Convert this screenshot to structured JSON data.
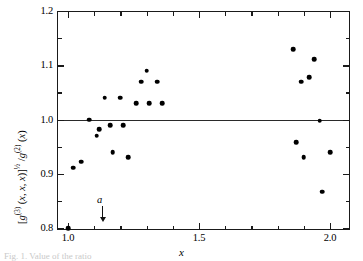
{
  "figure": {
    "caption_partial": "Fig. 1. Value of the ratio",
    "annotation": {
      "label": "a",
      "x_value": 1.13
    }
  },
  "chart_data": {
    "type": "scatter",
    "title": "",
    "xlabel": "x",
    "ylabel": "[g(3)(x, x, x)]^1/2 / g(2)(x)",
    "ylabel_parts": {
      "open_bracket": "[",
      "g3": "g",
      "sup3": "(3)",
      "args3": " (x, x, x)",
      "close_bracket": "]",
      "half": "½",
      "slash": " / ",
      "g2": "g",
      "sup2": "(2)",
      "args2": " (x)"
    },
    "xlim": [
      0.95,
      2.07
    ],
    "ylim": [
      0.8,
      1.2
    ],
    "xticks": [
      1.0,
      1.5,
      2.0
    ],
    "xticklabels": [
      "1.0",
      "1.5",
      "2.0"
    ],
    "xminorticks": [
      1.1,
      1.2,
      1.3,
      1.4,
      1.6,
      1.7,
      1.8,
      1.9
    ],
    "yticks": [
      0.8,
      0.9,
      1.0,
      1.1,
      1.2
    ],
    "yticklabels": [
      "0.8",
      "0.9",
      "1.0",
      "1.1",
      "1.2"
    ],
    "yminorticks": [
      0.85,
      0.95,
      1.05,
      1.15
    ],
    "grid": false,
    "legend": null,
    "reference_line": {
      "axis": "y",
      "value": 1.0
    },
    "marker": "filled-circle",
    "marker_color": "#000000",
    "points": [
      {
        "x": 1.0,
        "y": 0.8
      },
      {
        "x": 1.02,
        "y": 0.911
      },
      {
        "x": 1.05,
        "y": 0.922
      },
      {
        "x": 1.08,
        "y": 1.0
      },
      {
        "x": 1.11,
        "y": 0.97
      },
      {
        "x": 1.12,
        "y": 0.982
      },
      {
        "x": 1.14,
        "y": 1.04
      },
      {
        "x": 1.16,
        "y": 0.99
      },
      {
        "x": 1.17,
        "y": 0.94
      },
      {
        "x": 1.2,
        "y": 1.04
      },
      {
        "x": 1.21,
        "y": 0.99
      },
      {
        "x": 1.23,
        "y": 0.93
      },
      {
        "x": 1.26,
        "y": 1.03
      },
      {
        "x": 1.28,
        "y": 1.07
      },
      {
        "x": 1.3,
        "y": 1.09
      },
      {
        "x": 1.31,
        "y": 1.03
      },
      {
        "x": 1.34,
        "y": 1.07
      },
      {
        "x": 1.36,
        "y": 1.03
      },
      {
        "x": 1.86,
        "y": 1.13
      },
      {
        "x": 1.87,
        "y": 0.958
      },
      {
        "x": 1.89,
        "y": 1.07
      },
      {
        "x": 1.9,
        "y": 0.93
      },
      {
        "x": 1.92,
        "y": 1.078
      },
      {
        "x": 1.94,
        "y": 1.111
      },
      {
        "x": 1.96,
        "y": 0.998
      },
      {
        "x": 1.97,
        "y": 0.867
      },
      {
        "x": 2.0,
        "y": 0.94
      }
    ]
  }
}
